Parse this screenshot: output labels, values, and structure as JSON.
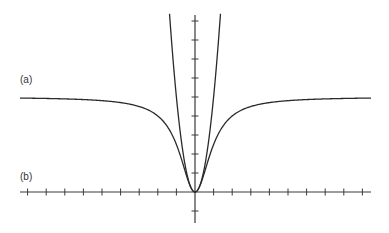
{
  "chart_data": {
    "type": "line",
    "title": "",
    "xlabel": "",
    "ylabel": "",
    "xlim": [
      -9.5,
      9.3
    ],
    "ylim": [
      -1.6,
      9.4
    ],
    "grid": false,
    "legend": "none",
    "x_ticks": [
      -9,
      -8,
      -7,
      -6,
      -5,
      -4,
      -3,
      -2,
      -1,
      1,
      2,
      3,
      4,
      5,
      6,
      7,
      8,
      9
    ],
    "y_ticks": [
      -1,
      1,
      2,
      3,
      4,
      5,
      6,
      7,
      8,
      9
    ],
    "tick_labels_shown": false,
    "series": [
      {
        "name": "(a)",
        "description": "curve rising from origin, leveling to horizontal asymptote",
        "asymptote_y": 5,
        "points": [
          {
            "x": -9.3,
            "y": 4.95
          },
          {
            "x": -6,
            "y": 4.86
          },
          {
            "x": -4,
            "y": 4.71
          },
          {
            "x": -3,
            "y": 4.5
          },
          {
            "x": -2,
            "y": 4.0
          },
          {
            "x": -1.5,
            "y": 3.46
          },
          {
            "x": -1,
            "y": 2.5
          },
          {
            "x": -0.5,
            "y": 1.0
          },
          {
            "x": 0,
            "y": 0
          },
          {
            "x": 0.5,
            "y": 1.0
          },
          {
            "x": 1,
            "y": 2.5
          },
          {
            "x": 1.5,
            "y": 3.46
          },
          {
            "x": 2,
            "y": 4.0
          },
          {
            "x": 3,
            "y": 4.5
          },
          {
            "x": 4,
            "y": 4.71
          },
          {
            "x": 6,
            "y": 4.86
          },
          {
            "x": 9.3,
            "y": 4.95
          }
        ]
      },
      {
        "name": "(b)",
        "description": "parabola through origin",
        "points": [
          {
            "x": -1.37,
            "y": 9.4
          },
          {
            "x": -1,
            "y": 5
          },
          {
            "x": -0.5,
            "y": 1.25
          },
          {
            "x": 0,
            "y": 0
          },
          {
            "x": 0.5,
            "y": 1.25
          },
          {
            "x": 1,
            "y": 5
          },
          {
            "x": 1.37,
            "y": 9.4
          }
        ]
      }
    ],
    "annotations": [
      {
        "text": "(a)",
        "position": "left, above curve (a) asymptote"
      },
      {
        "text": "(b)",
        "position": "left, just above x-axis"
      }
    ]
  },
  "labels": {
    "a": "(a)",
    "b": "(b)"
  },
  "colors": {
    "axis": "#3a3a3a",
    "curve": "#2a2a2a",
    "label": "#333333"
  }
}
